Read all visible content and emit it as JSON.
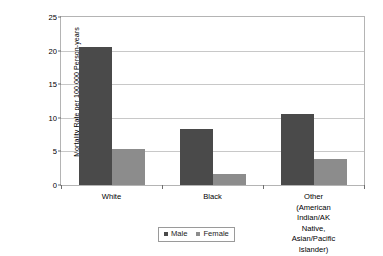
{
  "chart_data": {
    "type": "bar",
    "title": "",
    "xlabel": "",
    "ylabel": "Mortality Rate per 100,000 Person-years",
    "ylim": [
      0,
      25
    ],
    "yticks": [
      0,
      5,
      10,
      15,
      20,
      25
    ],
    "ytick_labels": [
      "0",
      "5",
      "10",
      "15",
      "20",
      "25"
    ],
    "grid": true,
    "legend_position": "bottom-center",
    "categories": [
      "White",
      "Black",
      "Other (American Indian/AK Native, Asian/Pacific Islander)"
    ],
    "category_label_lines": [
      [
        "White"
      ],
      [
        "Black"
      ],
      [
        "Other (American Indian/AK",
        "Native, Asian/Pacific Islander)"
      ]
    ],
    "series": [
      {
        "name": "Male",
        "color": "#4a4a4a",
        "values": [
          20.5,
          8.4,
          10.6
        ]
      },
      {
        "name": "Female",
        "color": "#8c8c8c",
        "values": [
          5.3,
          1.6,
          3.8
        ]
      }
    ]
  },
  "legend": {
    "items": [
      {
        "label": "Male"
      },
      {
        "label": "Female"
      }
    ]
  },
  "colors": {
    "male": "#4a4a4a",
    "female": "#8c8c8c",
    "gridline": "#c8c8c8",
    "axis": "#b4b4b4",
    "background": "#ffffff"
  }
}
